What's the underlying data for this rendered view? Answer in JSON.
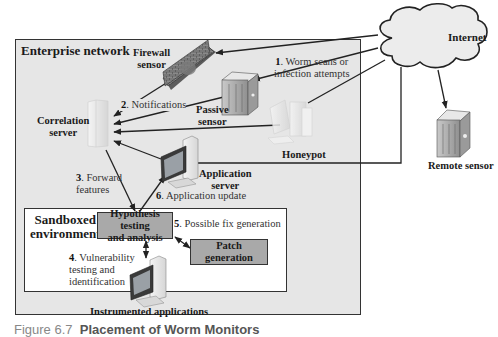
{
  "diagram": {
    "containers": {
      "enterprise_network": "Enterprise network",
      "sandboxed_environment": [
        "Sandboxed",
        "environment"
      ],
      "internet": "Internet"
    },
    "nodes": {
      "firewall_sensor": [
        "Firewall",
        "sensor"
      ],
      "passive_sensor": [
        "Passive",
        "sensor"
      ],
      "correlation_server": [
        "Correlation",
        "server"
      ],
      "honeypot": "Honeypot",
      "application_server": [
        "Application",
        "server"
      ],
      "remote_sensor": "Remote sensor",
      "hypothesis_testing": [
        "Hypothesis testing",
        "and analysis"
      ],
      "patch_generation": [
        "Patch",
        "generation"
      ],
      "instrumented_applications": "Instrumented applications"
    },
    "steps": [
      {
        "num": "1",
        "text": [
          "Worm scans or",
          "infection attempts"
        ]
      },
      {
        "num": "2",
        "text": [
          "Notifications"
        ]
      },
      {
        "num": "3",
        "text": [
          "Forward",
          "features"
        ]
      },
      {
        "num": "4",
        "text": [
          "Vulnerability",
          "testing and",
          "identification"
        ]
      },
      {
        "num": "5",
        "text": [
          "Possible fix generation"
        ]
      },
      {
        "num": "6",
        "text": [
          "Application update"
        ]
      }
    ],
    "colors": {
      "enterprise_bg": "#e6e6e6",
      "sandbox_bg": "#ffffff",
      "process_box": "#a9a9a9",
      "lines": "#222222"
    }
  },
  "caption": {
    "figure": "Figure 6.7",
    "title": "Placement of Worm Monitors"
  }
}
